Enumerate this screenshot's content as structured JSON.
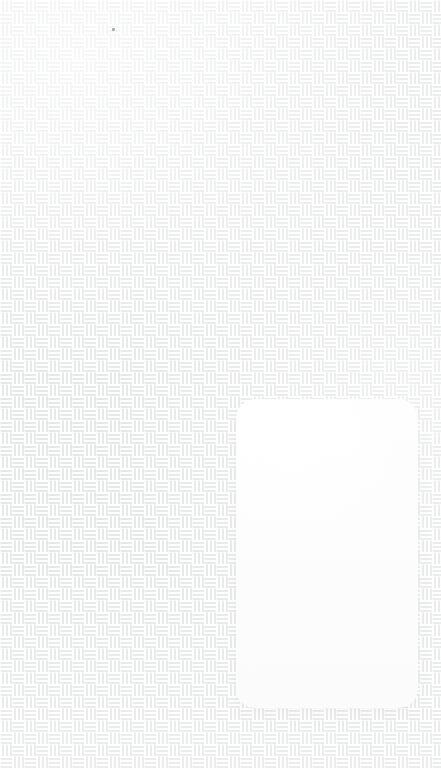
{
  "screen": {
    "width": 441,
    "height": 768,
    "description": "Blank mobile-style screen showing a woven fabric backdrop with a single empty white rounded card"
  },
  "background": {
    "name": "woven-basket-weave-texture",
    "base_color": "#e7e8e8",
    "thread_color": "#ffffff",
    "tile_size_px": 24,
    "block_size_px": 12,
    "thread_pitch_px": 4,
    "thread_width_px": 2
  },
  "card": {
    "name": "blank-white-card",
    "label": "",
    "content": "",
    "background_color": "#fdfdfd",
    "border_radius_px": 18,
    "x": 237,
    "y": 400,
    "width": 180,
    "height": 307
  },
  "artifacts": {
    "speck": {
      "name": "dark-speck",
      "color": "#9a9a9a",
      "x": 112,
      "y": 28,
      "size_px": 3
    }
  }
}
